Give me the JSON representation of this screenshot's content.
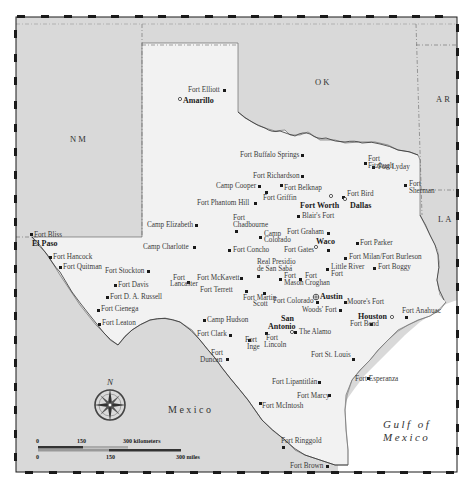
{
  "map": {
    "title": "Texas forts map",
    "colors": {
      "outside": "#d9d9d9",
      "texas": "#f2f2f2",
      "water": "#ffffff",
      "border": "#1a1a1a",
      "text": "#333333"
    },
    "regions": {
      "nm": "NM",
      "ok": "OK",
      "ar": "AR",
      "la": "LA",
      "mexico": "Mexico",
      "gulf_line1": "Gulf of",
      "gulf_line2": "Mexico"
    },
    "cities": [
      {
        "name": "Amarillo",
        "x": 181,
        "y": 103
      },
      {
        "name": "Fort Worth",
        "x": 300,
        "y": 205
      },
      {
        "name": "Dallas",
        "x": 350,
        "y": 205
      },
      {
        "name": "El Paso",
        "x": 32,
        "y": 245
      },
      {
        "name": "Waco",
        "x": 316,
        "y": 244
      },
      {
        "name": "Austin",
        "x": 320,
        "y": 298
      },
      {
        "name": "San",
        "x": 281,
        "y": 321
      },
      {
        "name": "Antonio",
        "x": 268,
        "y": 329
      },
      {
        "name": "Houston",
        "x": 358,
        "y": 317
      }
    ],
    "forts": [
      {
        "label": "Fort Elliott",
        "x": 203,
        "y": 92
      },
      {
        "label": "Fort Buffalo Springs",
        "x": 240,
        "y": 157
      },
      {
        "label": "Fort",
        "x": 368,
        "y": 157
      },
      {
        "label": "Fitzhugh",
        "x": 368,
        "y": 164
      },
      {
        "label": "Fort Lyday",
        "x": 395,
        "y": 170
      },
      {
        "label": "Fort Richardson",
        "x": 254,
        "y": 178
      },
      {
        "label": "Camp Cooper",
        "x": 216,
        "y": 188
      },
      {
        "label": "Fort Belknap",
        "x": 286,
        "y": 190
      },
      {
        "label": "Fort Bird",
        "x": 347,
        "y": 194
      },
      {
        "label": "Fort",
        "x": 409,
        "y": 185
      },
      {
        "label": "Sherman",
        "x": 409,
        "y": 192
      },
      {
        "label": "Fort Phantom Hill",
        "x": 197,
        "y": 205
      },
      {
        "label": "Fort Griffin",
        "x": 263,
        "y": 200
      },
      {
        "label": "Blair's Fort",
        "x": 303,
        "y": 220
      },
      {
        "label": "Camp Elizabeth",
        "x": 147,
        "y": 227
      },
      {
        "label": "Fort",
        "x": 233,
        "y": 221
      },
      {
        "label": "Chadbourne",
        "x": 233,
        "y": 228
      },
      {
        "label": "Fort Graham",
        "x": 287,
        "y": 234
      },
      {
        "label": "Camp",
        "x": 264,
        "y": 237
      },
      {
        "label": "Colorado",
        "x": 264,
        "y": 244
      },
      {
        "label": "Fort Bliss",
        "x": 34,
        "y": 237
      },
      {
        "label": "Camp Charlotte",
        "x": 143,
        "y": 250
      },
      {
        "label": "Fort Concho",
        "x": 233,
        "y": 253
      },
      {
        "label": "Fort Gates",
        "x": 284,
        "y": 253
      },
      {
        "label": "Fort Parker",
        "x": 360,
        "y": 245
      },
      {
        "label": "Fort Hancock",
        "x": 53,
        "y": 259
      },
      {
        "label": "Fort Milan/Fort Burleson",
        "x": 349,
        "y": 260
      },
      {
        "label": "Fort Quitman",
        "x": 60,
        "y": 270
      },
      {
        "label": "Real Presidio",
        "x": 257,
        "y": 265
      },
      {
        "label": "de San Sabá",
        "x": 257,
        "y": 272
      },
      {
        "label": "Little River",
        "x": 331,
        "y": 270
      },
      {
        "label": "Fort",
        "x": 331,
        "y": 277
      },
      {
        "label": "Fort Boggy",
        "x": 378,
        "y": 270
      },
      {
        "label": "Fort Stockton",
        "x": 105,
        "y": 273
      },
      {
        "label": "Fort",
        "x": 173,
        "y": 281
      },
      {
        "label": "Lancaster",
        "x": 170,
        "y": 287
      },
      {
        "label": "Fort McKavett",
        "x": 197,
        "y": 280
      },
      {
        "label": "Fort",
        "x": 284,
        "y": 278
      },
      {
        "label": "Mason",
        "x": 284,
        "y": 285
      },
      {
        "label": "Fort",
        "x": 305,
        "y": 278
      },
      {
        "label": "Croghan",
        "x": 305,
        "y": 285
      },
      {
        "label": "Fort Davis",
        "x": 118,
        "y": 287
      },
      {
        "label": "Fort D. A. Russell",
        "x": 110,
        "y": 299
      },
      {
        "label": "Fort Terrett",
        "x": 200,
        "y": 293
      },
      {
        "label": "Fort Martin",
        "x": 243,
        "y": 302
      },
      {
        "label": "Scott",
        "x": 253,
        "y": 309
      },
      {
        "label": "Fort Colorado",
        "x": 273,
        "y": 304
      },
      {
        "label": "Moore's Fort",
        "x": 347,
        "y": 304
      },
      {
        "label": "Fort Cienega",
        "x": 101,
        "y": 311
      },
      {
        "label": "Woods' Fort",
        "x": 303,
        "y": 312
      },
      {
        "label": "Fort Anahuac",
        "x": 402,
        "y": 314
      },
      {
        "label": "Fort Leaton",
        "x": 102,
        "y": 325
      },
      {
        "label": "Camp Hudson",
        "x": 207,
        "y": 322
      },
      {
        "label": "Fort Bend",
        "x": 350,
        "y": 326
      },
      {
        "label": "The Alamo",
        "x": 299,
        "y": 334
      },
      {
        "label": "Fort Clark",
        "x": 197,
        "y": 336
      },
      {
        "label": "Fort",
        "x": 245,
        "y": 343
      },
      {
        "label": "Inge",
        "x": 247,
        "y": 350
      },
      {
        "label": "Fort",
        "x": 266,
        "y": 340
      },
      {
        "label": "Lincoln",
        "x": 264,
        "y": 347
      },
      {
        "label": "Fort",
        "x": 211,
        "y": 355
      },
      {
        "label": "Duncan",
        "x": 200,
        "y": 362
      },
      {
        "label": "Fort St. Louis",
        "x": 311,
        "y": 357
      },
      {
        "label": "Fort Lipantitlán",
        "x": 272,
        "y": 384
      },
      {
        "label": "Fort Esperanza",
        "x": 353,
        "y": 381
      },
      {
        "label": "Fort Marcy",
        "x": 297,
        "y": 398
      },
      {
        "label": "Fort McIntosh",
        "x": 242,
        "y": 408
      },
      {
        "label": "Fort Ringgold",
        "x": 281,
        "y": 442
      },
      {
        "label": "Fort Brown",
        "x": 290,
        "y": 466
      }
    ],
    "compass": {
      "label": "N"
    },
    "scale": {
      "km": {
        "zero": "0",
        "mid": "150",
        "end": "300 kilometers"
      },
      "mi": {
        "zero": "0",
        "mid": "150",
        "end": "300 miles"
      }
    }
  }
}
